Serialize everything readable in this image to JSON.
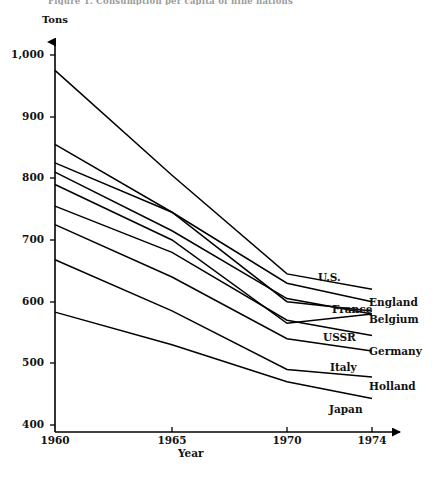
{
  "figure": {
    "cut_title": "Figure 1.  Consumption per capita of nine nations",
    "y_axis_title": "Tons",
    "x_axis_title": "Year"
  },
  "chart_data": {
    "type": "line",
    "title": "",
    "xlabel": "Year",
    "ylabel": "Tons",
    "x": [
      1960,
      1965,
      1970,
      1974
    ],
    "xticks": [
      "1960",
      "1965",
      "1970",
      "1974"
    ],
    "yticks": [
      "400",
      "500",
      "600",
      "700",
      "800",
      "900",
      "1,000"
    ],
    "ylim": [
      400,
      1000
    ],
    "xlim": [
      1960,
      1974
    ],
    "grid": false,
    "legend": "right-inline-labels",
    "series": [
      {
        "name": "U.S.",
        "label": "U.S.",
        "values": [
          975,
          805,
          645,
          620
        ],
        "label_x": 318,
        "label_y": 271
      },
      {
        "name": "England",
        "label": "England",
        "values": [
          855,
          745,
          630,
          600
        ],
        "label_x": 369,
        "label_y": 296
      },
      {
        "name": "France",
        "label": "France",
        "values": [
          825,
          745,
          600,
          585
        ],
        "label_x": 332,
        "label_y": 303
      },
      {
        "name": "Belgium",
        "label": "Belgium",
        "values": [
          810,
          715,
          605,
          580
        ],
        "label_x": 369,
        "label_y": 313
      },
      {
        "name": "USSR",
        "label": "USSR",
        "values": [
          790,
          700,
          565,
          580
        ],
        "label_x": 323,
        "label_y": 331
      },
      {
        "name": "Germany",
        "label": "Germany",
        "values": [
          755,
          680,
          570,
          545
        ],
        "label_x": 369,
        "label_y": 345
      },
      {
        "name": "Italy",
        "label": "Italy",
        "values": [
          725,
          640,
          540,
          520
        ],
        "label_x": 330,
        "label_y": 361
      },
      {
        "name": "Holland",
        "label": "Holland",
        "values": [
          668,
          585,
          490,
          478
        ],
        "label_x": 369,
        "label_y": 380
      },
      {
        "name": "Japan",
        "label": "Japan",
        "values": [
          583,
          530,
          470,
          443
        ],
        "label_x": 329,
        "label_y": 403
      }
    ]
  },
  "axes": {
    "y_tick_labels": [
      {
        "text": "1,000",
        "y": 55
      },
      {
        "text": "900",
        "y": 117
      },
      {
        "text": "800",
        "y": 178
      },
      {
        "text": "700",
        "y": 240
      },
      {
        "text": "600",
        "y": 302
      },
      {
        "text": "500",
        "y": 363
      },
      {
        "text": "400",
        "y": 425
      }
    ],
    "x_tick_labels": [
      {
        "text": "1960",
        "x": 55
      },
      {
        "text": "1965",
        "x": 172
      },
      {
        "text": "1970",
        "x": 287
      },
      {
        "text": "1974",
        "x": 372
      }
    ]
  }
}
